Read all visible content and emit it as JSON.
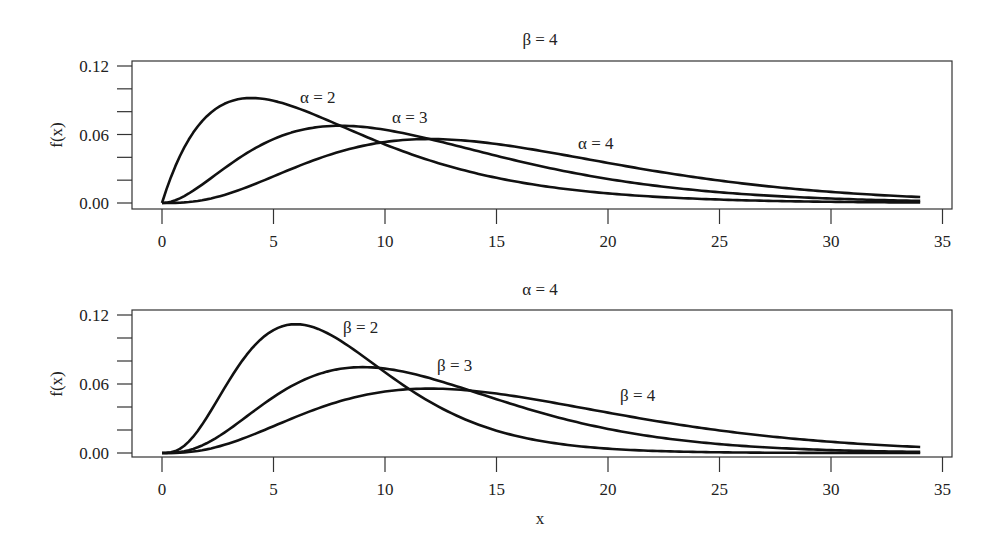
{
  "chart_data": [
    {
      "type": "line",
      "title": "β = 4",
      "xlabel": "",
      "ylabel": "f(x)",
      "xlim": [
        -1.3,
        35.4
      ],
      "ylim": [
        0,
        0.12
      ],
      "xticks": [
        "0",
        "5",
        "10",
        "15",
        "20",
        "25",
        "30",
        "35"
      ],
      "yticks": [
        "0.00",
        "0.06",
        "0.12"
      ],
      "grid": false,
      "legend": "inline labels",
      "x": [
        0,
        2,
        4,
        6,
        8,
        10,
        12,
        14,
        16,
        18,
        20,
        22,
        24,
        26,
        28,
        30,
        32,
        34
      ],
      "series": [
        {
          "name": "α = 2",
          "alpha": 2,
          "beta": 4,
          "values": [
            0,
            0.0758,
            0.092,
            0.0837,
            0.0677,
            0.0513,
            0.0373,
            0.0264,
            0.0183,
            0.0125,
            0.0084,
            0.0056,
            0.0037,
            0.0024,
            0.0016,
            0.001,
            0.0007,
            0.0004
          ]
        },
        {
          "name": "α = 3",
          "alpha": 3,
          "beta": 4,
          "values": [
            0,
            0.019,
            0.046,
            0.0628,
            0.0677,
            0.0641,
            0.056,
            0.0463,
            0.0366,
            0.0281,
            0.0211,
            0.0155,
            0.0112,
            0.008,
            0.0056,
            0.0039,
            0.0027,
            0.0018
          ]
        },
        {
          "name": "α = 4",
          "alpha": 4,
          "beta": 4,
          "values": [
            0,
            0.0032,
            0.0153,
            0.0314,
            0.0451,
            0.0534,
            0.056,
            0.054,
            0.0488,
            0.0421,
            0.0351,
            0.0284,
            0.0224,
            0.0173,
            0.0131,
            0.0098,
            0.0072,
            0.0052
          ]
        }
      ]
    },
    {
      "type": "line",
      "title": "α = 4",
      "xlabel": "x",
      "ylabel": "f(x)",
      "xlim": [
        -1.3,
        35.4
      ],
      "ylim": [
        0,
        0.12
      ],
      "xticks": [
        "0",
        "5",
        "10",
        "15",
        "20",
        "25",
        "30",
        "35"
      ],
      "yticks": [
        "0.00",
        "0.06",
        "0.12"
      ],
      "grid": false,
      "legend": "inline labels",
      "x": [
        0,
        2,
        4,
        6,
        8,
        10,
        12,
        14,
        16,
        18,
        20,
        22,
        24,
        26,
        28,
        30,
        32,
        34
      ],
      "series": [
        {
          "name": "β = 2",
          "alpha": 4,
          "beta": 2,
          "values": [
            0,
            0.0307,
            0.0902,
            0.112,
            0.0977,
            0.0702,
            0.0446,
            0.026,
            0.0143,
            0.0075,
            0.0038,
            0.0018,
            0.0009,
            0.0004,
            0.0002,
            0.0001,
            0.0,
            0.0
          ]
        },
        {
          "name": "β = 3",
          "alpha": 4,
          "beta": 3,
          "values": [
            0,
            0.0085,
            0.0347,
            0.0601,
            0.0731,
            0.0737,
            0.0651,
            0.0529,
            0.0405,
            0.0297,
            0.021,
            0.0144,
            0.0096,
            0.0063,
            0.004,
            0.0025,
            0.0016,
            0.001
          ]
        },
        {
          "name": "β = 4",
          "alpha": 4,
          "beta": 4,
          "values": [
            0,
            0.0032,
            0.0153,
            0.0314,
            0.0451,
            0.0534,
            0.056,
            0.054,
            0.0488,
            0.0421,
            0.0351,
            0.0284,
            0.0224,
            0.0173,
            0.0131,
            0.0098,
            0.0072,
            0.0052
          ]
        }
      ]
    }
  ],
  "panels": [
    {
      "title": "β = 4",
      "ylabel": "f(x)",
      "labels": [
        "α = 2",
        "α = 3",
        "α = 4"
      ]
    },
    {
      "title": "α = 4",
      "ylabel": "f(x)",
      "xlabel": "x",
      "labels": [
        "β = 2",
        "β = 3",
        "β = 4"
      ]
    }
  ]
}
